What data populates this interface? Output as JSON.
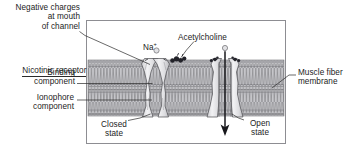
{
  "figure": {
    "frame_color": "#8d8d92",
    "membrane_color": "#a8a8a8",
    "ink_color": "#1c1c1c"
  },
  "labels": {
    "negative_charges": "Negative charges\nat mouth\nof channel",
    "nicotinic_receptor": "Nicotinic receptor",
    "binding_component": "Binding\ncomponent",
    "ionophore_component": "Ionophore\ncomponent",
    "acetylcholine": "Acetylcholine",
    "sodium_ion": "Na",
    "sodium_charge": "+",
    "muscle_fiber_membrane": "Muscle fiber\nmembrane",
    "closed_state": "Closed\nstate",
    "open_state": "Open\nstate"
  },
  "structures": {
    "closed_channel": "closed-channel-protein",
    "open_channel": "open-channel-protein",
    "lipid_bilayer": "lipid-bilayer-membrane",
    "ion_flow_arrow": "sodium-influx-arrow",
    "acetylcholine_molecules": 3
  }
}
